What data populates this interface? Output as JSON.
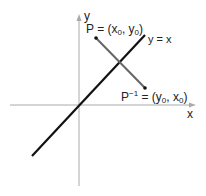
{
  "diagram": {
    "axes": {
      "x_label": "x",
      "y_label": "y"
    },
    "line": {
      "label": "y = x",
      "color": "#111111"
    },
    "segment_color": "#666666",
    "points": {
      "P": {
        "name": "P",
        "eq": " = (x",
        "sub1": "0",
        "mid": ", y",
        "sub2": "0",
        "close": ")"
      },
      "P_inv": {
        "name": "P",
        "sup": "−1",
        "eq": " = (y",
        "sub1": "0",
        "mid": ", x",
        "sub2": "0",
        "close": ")"
      }
    },
    "axis_color": "#aaaaaa"
  }
}
